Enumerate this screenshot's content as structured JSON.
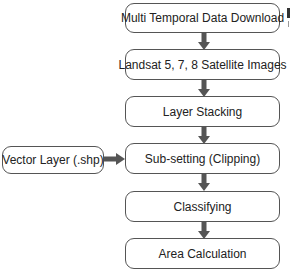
{
  "diagram": {
    "type": "flowchart",
    "steps": [
      {
        "id": "download",
        "label": "Multi Temporal Data Download"
      },
      {
        "id": "landsat",
        "label": "Landsat 5, 7, 8 Satellite Images"
      },
      {
        "id": "stacking",
        "label": "Layer Stacking"
      },
      {
        "id": "subsetting",
        "label": "Sub-setting (Clipping)"
      },
      {
        "id": "classifying",
        "label": "Classifying"
      },
      {
        "id": "area",
        "label": "Area Calculation"
      }
    ],
    "side_input": {
      "id": "vector",
      "label": "Vector Layer (.shp)",
      "target": "subsetting"
    },
    "colors": {
      "border": "#555555",
      "arrow": "#555555",
      "background": "#ffffff",
      "text": "#222222"
    }
  }
}
